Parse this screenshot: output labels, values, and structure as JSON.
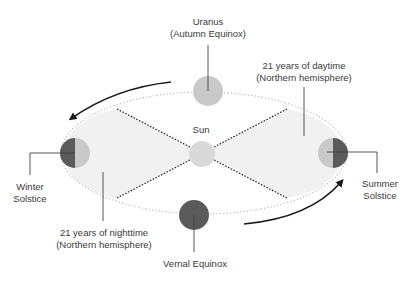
{
  "diagram": {
    "colors": {
      "background": "#ffffff",
      "orbit_fill": "#f1f1f1",
      "orbit_dots": "#b5b5b5",
      "sun": "#d9d9d9",
      "planet_light": "#c9c9c9",
      "planet_dark": "#5a5a5a",
      "arrow": "#1a1a1a",
      "leader": "#444444",
      "text": "#3a3a3a"
    },
    "labels": {
      "sun": "Sun",
      "uranus_line1": "Uranus",
      "uranus_line2": "(Autumn Equinox)",
      "daytime_line1": "21 years of daytime",
      "daytime_line2": "(Northern hemisphere)",
      "nighttime_line1": "21 years of nighttime",
      "nighttime_line2": "(Northern hemisphere)",
      "winter_line1": "Winter",
      "winter_line2": "Solstice",
      "summer_line1": "Summer",
      "summer_line2": "Solstice",
      "vernal": "Vernal Equinox"
    },
    "nodes": [
      {
        "id": "sun",
        "label": "Sun"
      },
      {
        "id": "autumn-equinox",
        "label": "Uranus (Autumn Equinox)",
        "shade": "light"
      },
      {
        "id": "winter-solstice",
        "label": "Winter Solstice",
        "shade": "half-dark-left"
      },
      {
        "id": "summer-solstice",
        "label": "Summer Solstice",
        "shade": "half-dark-right"
      },
      {
        "id": "vernal-equinox",
        "label": "Vernal Equinox",
        "shade": "dark"
      }
    ]
  }
}
